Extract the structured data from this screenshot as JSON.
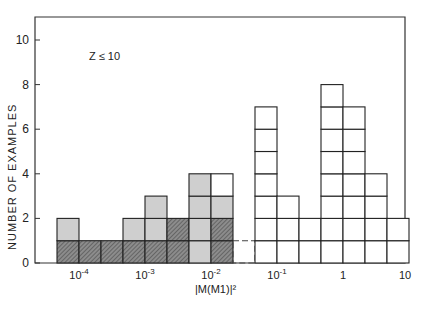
{
  "chart_data": {
    "type": "bar",
    "title": "",
    "annotation": "Z ≤ 10",
    "xlabel": "|M(M1)|²",
    "ylabel": "NUMBER OF EXAMPLES",
    "xscale": "log",
    "xlim": [
      5e-05,
      10
    ],
    "ylim": [
      0,
      11
    ],
    "yticks": [
      0,
      2,
      4,
      6,
      8,
      10
    ],
    "xticks": [
      "10⁻⁴",
      "10⁻³",
      "10⁻²",
      "10⁻¹",
      "1",
      "10"
    ],
    "bin_width_decades": 0.333,
    "grid": false,
    "legend": null,
    "stacking": "stacked; each box = 1 example",
    "series": [
      {
        "name": "hatched (dark)",
        "color": "#7a7a7a"
      },
      {
        "name": "gray (light)",
        "color": "#c8c8c8"
      },
      {
        "name": "open (white)",
        "color": "#ffffff"
      }
    ],
    "bins": [
      {
        "x_left": "5.6e-5",
        "hatched": 1,
        "gray": 1,
        "open": 0,
        "total": 2
      },
      {
        "x_left": "1.0e-4",
        "hatched": 1,
        "gray": 0,
        "open": 0,
        "total": 1
      },
      {
        "x_left": "2.2e-4",
        "hatched": 1,
        "gray": 0,
        "open": 0,
        "total": 1
      },
      {
        "x_left": "4.6e-4",
        "hatched": 1,
        "gray": 1,
        "open": 0,
        "total": 2
      },
      {
        "x_left": "1.0e-3",
        "hatched": 1,
        "gray": 2,
        "open": 0,
        "total": 3
      },
      {
        "x_left": "2.2e-3",
        "hatched": 2,
        "gray": 0,
        "open": 0,
        "total": 2
      },
      {
        "x_left": "4.6e-3",
        "hatched": 0,
        "gray": 4,
        "open": 0,
        "total": 4
      },
      {
        "x_left": "1.0e-2",
        "hatched": 2,
        "gray": 1,
        "open": 1,
        "total": 4
      },
      {
        "x_left": "2.2e-2",
        "hatched": 0,
        "gray": 0,
        "open": 1,
        "total": 1,
        "note": "dashed"
      },
      {
        "x_left": "4.6e-2",
        "hatched": 0,
        "gray": 0,
        "open": 7,
        "total": 7
      },
      {
        "x_left": "1.0e-1",
        "hatched": 0,
        "gray": 0,
        "open": 3,
        "total": 3
      },
      {
        "x_left": "2.2e-1",
        "hatched": 0,
        "gray": 0,
        "open": 2,
        "total": 2
      },
      {
        "x_left": "4.6e-1",
        "hatched": 0,
        "gray": 0,
        "open": 8,
        "total": 8
      },
      {
        "x_left": "1.0",
        "hatched": 0,
        "gray": 0,
        "open": 7,
        "total": 7
      },
      {
        "x_left": "2.2",
        "hatched": 0,
        "gray": 0,
        "open": 4,
        "total": 4
      },
      {
        "x_left": "4.6",
        "hatched": 0,
        "gray": 0,
        "open": 2,
        "total": 2
      }
    ]
  },
  "labels": {
    "ylabel": "NUMBER OF EXAMPLES",
    "note": "Z ≤ 10",
    "xlabel": "|M(M1)|²"
  }
}
